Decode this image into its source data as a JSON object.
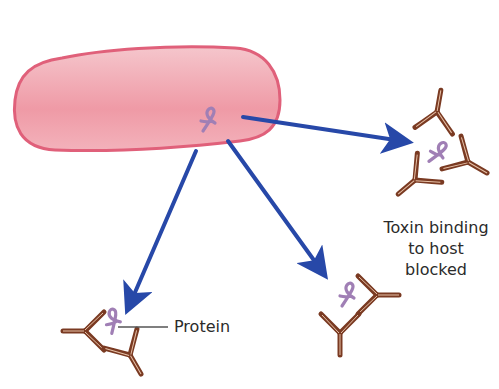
{
  "diagram": {
    "type": "biology-illustration",
    "bacterium": {
      "shape": "rod",
      "fill": "#f2a3ae",
      "stroke": "#e0607a"
    },
    "toxin": {
      "color": "#a07fb5",
      "icon": "ribbon-protein-icon"
    },
    "arrow_color": "#2748a8",
    "antibody_color": "#7a3a22",
    "labels": {
      "blocked": [
        "Toxin binding",
        "to host",
        "blocked"
      ],
      "protein": "Protein"
    }
  }
}
